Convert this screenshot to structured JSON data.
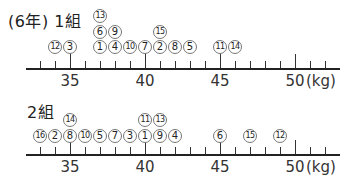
{
  "chart_data": {
    "type": "dot-plot",
    "xlabel": "(kg)",
    "xlim": [
      32,
      52.5
    ],
    "ticks": [
      33,
      34,
      35,
      36,
      37,
      38,
      39,
      40,
      41,
      42,
      43,
      44,
      45,
      46,
      47,
      48,
      49,
      50,
      51,
      52
    ],
    "tick_labels": [
      "35",
      "40",
      "45",
      "50"
    ],
    "unit": "(kg)",
    "series": [
      {
        "name": "1組",
        "label": "(6年) 1組",
        "points": [
          {
            "student": "12",
            "value": 34,
            "stack": 0
          },
          {
            "student": "3",
            "value": 35,
            "stack": 0
          },
          {
            "student": "1",
            "value": 37,
            "stack": 0
          },
          {
            "student": "6",
            "value": 37,
            "stack": 1
          },
          {
            "student": "13",
            "value": 37,
            "stack": 2
          },
          {
            "student": "4",
            "value": 38,
            "stack": 0
          },
          {
            "student": "9",
            "value": 38,
            "stack": 1
          },
          {
            "student": "10",
            "value": 39,
            "stack": 0
          },
          {
            "student": "7",
            "value": 40,
            "stack": 0
          },
          {
            "student": "2",
            "value": 41,
            "stack": 0
          },
          {
            "student": "15",
            "value": 41,
            "stack": 1
          },
          {
            "student": "8",
            "value": 42,
            "stack": 0
          },
          {
            "student": "5",
            "value": 43,
            "stack": 0
          },
          {
            "student": "11",
            "value": 45,
            "stack": 0
          },
          {
            "student": "14",
            "value": 46,
            "stack": 0
          }
        ]
      },
      {
        "name": "2組",
        "label": "2組",
        "points": [
          {
            "student": "16",
            "value": 33,
            "stack": 0
          },
          {
            "student": "2",
            "value": 34,
            "stack": 0
          },
          {
            "student": "8",
            "value": 35,
            "stack": 0
          },
          {
            "student": "14",
            "value": 35,
            "stack": 1
          },
          {
            "student": "10",
            "value": 36,
            "stack": 0
          },
          {
            "student": "5",
            "value": 37,
            "stack": 0
          },
          {
            "student": "7",
            "value": 38,
            "stack": 0
          },
          {
            "student": "3",
            "value": 39,
            "stack": 0
          },
          {
            "student": "1",
            "value": 40,
            "stack": 0
          },
          {
            "student": "11",
            "value": 40,
            "stack": 1
          },
          {
            "student": "9",
            "value": 41,
            "stack": 0
          },
          {
            "student": "13",
            "value": 41,
            "stack": 1
          },
          {
            "student": "4",
            "value": 42,
            "stack": 0
          },
          {
            "student": "6",
            "value": 45,
            "stack": 0
          },
          {
            "student": "15",
            "value": 47,
            "stack": 0
          },
          {
            "student": "12",
            "value": 49,
            "stack": 0
          }
        ]
      }
    ]
  },
  "class1": {
    "title": "(6年) 1組"
  },
  "class2": {
    "title": "2組"
  },
  "axis": {
    "unit": "(kg)",
    "labels": [
      "35",
      "40",
      "45",
      "50"
    ]
  }
}
